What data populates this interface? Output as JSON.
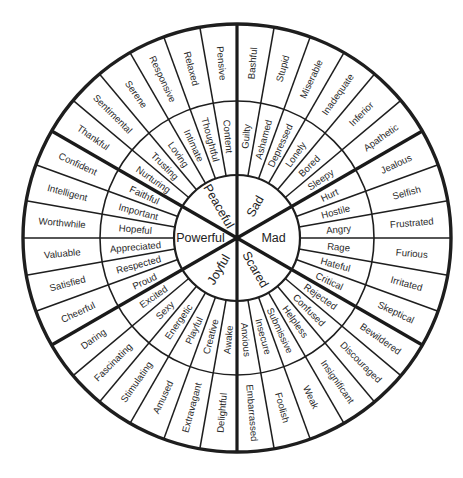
{
  "geometry": {
    "center": [
      237,
      238
    ],
    "r_core": 63,
    "r_middle": 137,
    "r_outer": 214
  },
  "colors": {
    "line": "#1e1e1e",
    "text": "#2a2a2a",
    "background": "#ffffff"
  },
  "segments": [
    {
      "core": "Sad",
      "start_angle": -90,
      "middle": [
        "Guilty",
        "Ashamed",
        "Depressed",
        "Lonely",
        "Bored",
        "Sleepy"
      ],
      "outer": [
        "Bashful",
        "Stupid",
        "Miserable",
        "Inadequate",
        "Inferior",
        "Apathetic"
      ]
    },
    {
      "core": "Mad",
      "start_angle": -30,
      "middle": [
        "Hurt",
        "Hostile",
        "Angry",
        "Rage",
        "Hateful",
        "Critical"
      ],
      "outer": [
        "Jealous",
        "Selfish",
        "Frustrated",
        "Furious",
        "Irritated",
        "Skeptical"
      ]
    },
    {
      "core": "Scared",
      "start_angle": 30,
      "middle": [
        "Rejected",
        "Confused",
        "Helpless",
        "Submissive",
        "Insecure",
        "Anxious"
      ],
      "outer": [
        "Bewildered",
        "Discouraged",
        "Insignificant",
        "Weak",
        "Foolish",
        "Embarrassed"
      ]
    },
    {
      "core": "Joyful",
      "start_angle": 90,
      "middle": [
        "Awake",
        "Creative",
        "Playful",
        "Energetic",
        "Sexy",
        "Excited"
      ],
      "outer": [
        "Delightful",
        "Extravagant",
        "Amused",
        "Stimulating",
        "Fascinating",
        "Daring"
      ]
    },
    {
      "core": "Powerful",
      "start_angle": 150,
      "middle": [
        "Proud",
        "Respected",
        "Appreciated",
        "Hopeful",
        "Important",
        "Faithful"
      ],
      "outer": [
        "Cheerful",
        "Satisfied",
        "Valuable",
        "Worthwhile",
        "Intelligent",
        "Confident"
      ]
    },
    {
      "core": "Peaceful",
      "start_angle": 210,
      "middle": [
        "Nurturing",
        "Trusting",
        "Loving",
        "Intimate",
        "Thoughtful",
        "Content"
      ],
      "outer": [
        "Thankful",
        "Sentimental",
        "Serene",
        "Responsive",
        "Relaxed",
        "Pensive"
      ]
    }
  ]
}
